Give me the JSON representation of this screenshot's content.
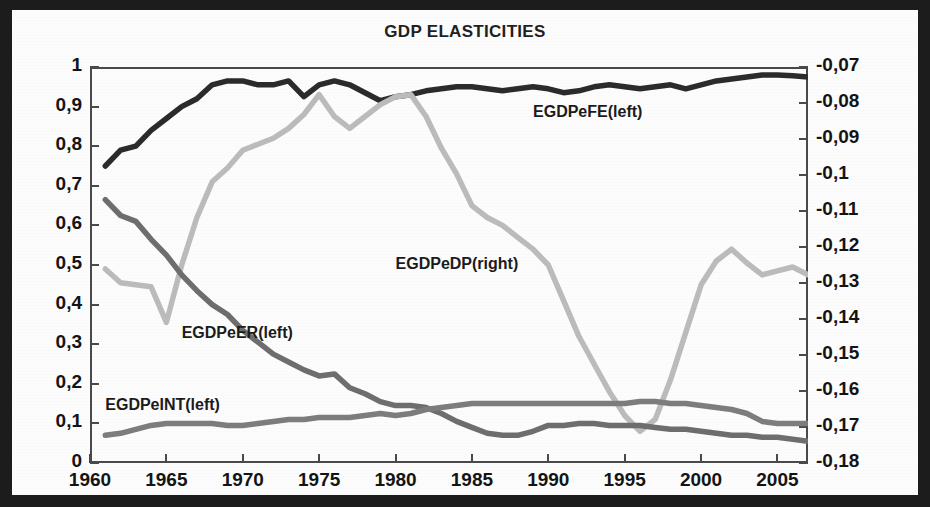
{
  "chart_data": {
    "type": "line",
    "title": "GDP ELASTICITIES",
    "xlabel": "",
    "ylabel": "",
    "grid": false,
    "legend_position": "inline-labels",
    "xlim": [
      1960,
      2007
    ],
    "xticks": [
      "1960",
      "1965",
      "1970",
      "1975",
      "1980",
      "1985",
      "1990",
      "1995",
      "2000",
      "2005"
    ],
    "xtick_values": [
      1960,
      1965,
      1970,
      1975,
      1980,
      1985,
      1990,
      1995,
      2000,
      2005
    ],
    "left_axis": {
      "ylim": [
        0,
        1
      ],
      "ticks": [
        "0",
        "0,1",
        "0,2",
        "0,3",
        "0,4",
        "0,5",
        "0,6",
        "0,7",
        "0,8",
        "0,9",
        "1"
      ],
      "tick_values": [
        0,
        0.1,
        0.2,
        0.3,
        0.4,
        0.5,
        0.6,
        0.7,
        0.8,
        0.9,
        1
      ]
    },
    "right_axis": {
      "ylim": [
        -0.18,
        -0.07
      ],
      "ticks": [
        "-0,18",
        "-0,17",
        "-0,16",
        "-0,15",
        "-0,14",
        "-0,13",
        "-0,12",
        "-0,11",
        "-0,1",
        "-0,09",
        "-0,08",
        "-0,07"
      ],
      "tick_values": [
        -0.18,
        -0.17,
        -0.16,
        -0.15,
        -0.14,
        -0.13,
        -0.12,
        -0.11,
        -0.1,
        -0.09,
        -0.08,
        -0.07
      ]
    },
    "x": [
      1961,
      1962,
      1963,
      1964,
      1965,
      1966,
      1967,
      1968,
      1969,
      1970,
      1971,
      1972,
      1973,
      1974,
      1975,
      1976,
      1977,
      1978,
      1979,
      1980,
      1981,
      1982,
      1983,
      1984,
      1985,
      1986,
      1987,
      1988,
      1989,
      1990,
      1991,
      1992,
      1993,
      1994,
      1995,
      1996,
      1997,
      1998,
      1999,
      2000,
      2001,
      2002,
      2003,
      2004,
      2005,
      2006,
      2007
    ],
    "series": [
      {
        "name": "EGDPeFE(left)",
        "axis": "left",
        "color": "#2b2b2b",
        "label": "EGDPeFE(left)",
        "values": [
          0.75,
          0.79,
          0.8,
          0.84,
          0.87,
          0.9,
          0.92,
          0.955,
          0.965,
          0.965,
          0.955,
          0.955,
          0.965,
          0.925,
          0.955,
          0.965,
          0.955,
          0.935,
          0.915,
          0.925,
          0.93,
          0.94,
          0.945,
          0.95,
          0.95,
          0.945,
          0.94,
          0.945,
          0.95,
          0.945,
          0.935,
          0.94,
          0.95,
          0.955,
          0.95,
          0.945,
          0.95,
          0.955,
          0.945,
          0.955,
          0.965,
          0.97,
          0.975,
          0.98,
          0.98,
          0.978,
          0.975
        ]
      },
      {
        "name": "EGDPeDP(right)",
        "axis": "right",
        "color": "#bcbcbc",
        "label": "EGDPeDP(right)",
        "values": [
          0.49,
          0.455,
          0.45,
          0.445,
          0.355,
          0.5,
          0.62,
          0.71,
          0.745,
          0.79,
          0.805,
          0.82,
          0.845,
          0.88,
          0.93,
          0.875,
          0.845,
          0.875,
          0.905,
          0.925,
          0.93,
          0.875,
          0.795,
          0.73,
          0.65,
          0.62,
          0.6,
          0.57,
          0.54,
          0.5,
          0.41,
          0.32,
          0.25,
          0.18,
          0.12,
          0.08,
          0.11,
          0.21,
          0.33,
          0.45,
          0.51,
          0.54,
          0.505,
          0.475,
          0.485,
          0.495,
          0.475
        ]
      },
      {
        "name": "EGDPeER(left)",
        "axis": "left",
        "color": "#6e6e6e",
        "label": "EGDPeER(left)",
        "values": [
          0.665,
          0.625,
          0.61,
          0.565,
          0.525,
          0.475,
          0.435,
          0.4,
          0.375,
          0.335,
          0.305,
          0.275,
          0.255,
          0.235,
          0.22,
          0.225,
          0.19,
          0.175,
          0.155,
          0.145,
          0.145,
          0.14,
          0.125,
          0.105,
          0.09,
          0.075,
          0.07,
          0.07,
          0.08,
          0.095,
          0.095,
          0.1,
          0.1,
          0.095,
          0.095,
          0.095,
          0.09,
          0.085,
          0.085,
          0.08,
          0.075,
          0.07,
          0.07,
          0.065,
          0.065,
          0.06,
          0.055
        ]
      },
      {
        "name": "EGDPeINT(left)",
        "axis": "left",
        "color": "#7d7d7d",
        "label": "EGDPeINT(left)",
        "values": [
          0.07,
          0.075,
          0.085,
          0.095,
          0.1,
          0.1,
          0.1,
          0.1,
          0.095,
          0.095,
          0.1,
          0.105,
          0.11,
          0.11,
          0.115,
          0.115,
          0.115,
          0.12,
          0.125,
          0.12,
          0.125,
          0.135,
          0.14,
          0.145,
          0.15,
          0.15,
          0.15,
          0.15,
          0.15,
          0.15,
          0.15,
          0.15,
          0.15,
          0.15,
          0.15,
          0.155,
          0.155,
          0.15,
          0.15,
          0.145,
          0.14,
          0.135,
          0.125,
          0.105,
          0.1,
          0.1,
          0.1
        ]
      }
    ],
    "annotations": [
      {
        "text": "EGDPeFE(left)",
        "x": 1989,
        "y": 0.885
      },
      {
        "text": "EGDPeDP(right)",
        "x": 1980,
        "y": 0.5
      },
      {
        "text": "EGDPeER(left)",
        "x": 1966,
        "y": 0.325
      },
      {
        "text": "EGDPeINT(left)",
        "x": 1961,
        "y": 0.145
      }
    ]
  }
}
